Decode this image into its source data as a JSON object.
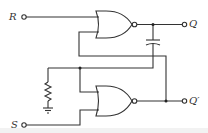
{
  "diagram": {
    "labels": {
      "r_input": "R",
      "s_input": "S",
      "q_output": "Q",
      "q_not_output": "Q′"
    },
    "components": [
      {
        "type": "nor-gate",
        "id": "gate-top"
      },
      {
        "type": "nor-gate",
        "id": "gate-bottom"
      },
      {
        "type": "capacitor",
        "id": "cap"
      },
      {
        "type": "resistor",
        "id": "res"
      },
      {
        "type": "ground",
        "id": "gnd"
      }
    ],
    "colors": {
      "line": "#333333",
      "background": "#ffffff"
    }
  }
}
